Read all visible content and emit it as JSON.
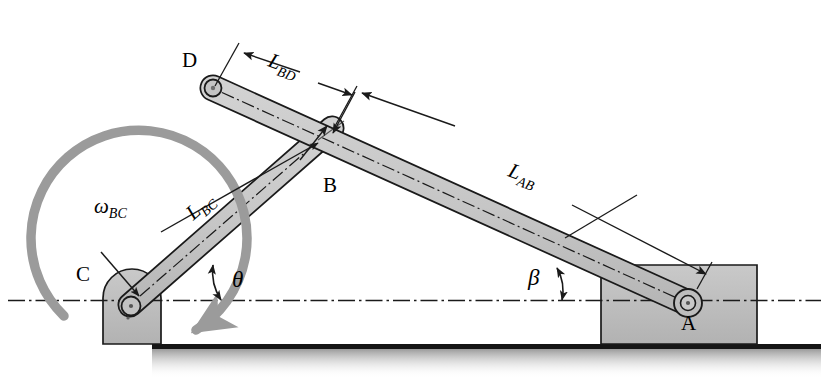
{
  "figure": {
    "type": "mechanism-kinematic-diagram",
    "background": "#ffffff"
  },
  "colors": {
    "link_fill": "#c8c8c8",
    "block_fill": "#bfbfbf",
    "outline": "#1a1a1a",
    "omega_arrow": "#9b9b9b",
    "ground_line": "#151515",
    "centerline": "#1a1a1a"
  },
  "joints": [
    {
      "id": "A",
      "label": "A",
      "x": 688,
      "y": 303,
      "kind": "pin-in-ground-block"
    },
    {
      "id": "B",
      "label": "B",
      "x": 330,
      "y": 130,
      "kind": "pin-joint"
    },
    {
      "id": "C",
      "label": "C",
      "x": 130,
      "y": 305,
      "kind": "pin-in-ground-block"
    },
    {
      "id": "D",
      "label": "D",
      "x": 213,
      "y": 88,
      "kind": "free-end-pin"
    }
  ],
  "point_labels": {
    "A": "A",
    "B": "B",
    "C": "C",
    "D": "D"
  },
  "dimensions": [
    {
      "id": "L_BD",
      "base": "L",
      "sub": "BD",
      "from": "D",
      "to": "B"
    },
    {
      "id": "L_AB",
      "base": "L",
      "sub": "AB",
      "from": "B",
      "to": "A"
    },
    {
      "id": "L_BC",
      "base": "L",
      "sub": "BC",
      "from": "C",
      "to": "B"
    }
  ],
  "angles": [
    {
      "id": "theta",
      "symbol": "θ",
      "between": "link BC and horizontal centerline"
    },
    {
      "id": "beta",
      "symbol": "β",
      "between": "link AB and horizontal centerline"
    }
  ],
  "velocities": [
    {
      "id": "omega_BC",
      "base": "ω",
      "sub": "BC",
      "sense": "counterclockwise",
      "color": "#9b9b9b"
    }
  ],
  "links": [
    {
      "id": "DA",
      "from": "D",
      "through": "B",
      "to": "A",
      "fill": "#c8c8c8"
    },
    {
      "id": "CB",
      "from": "C",
      "to": "B",
      "fill": "#c8c8c8"
    }
  ],
  "ground": {
    "line_y": 345,
    "style": "solid-line-with-shaded-fade"
  },
  "centerline": {
    "y": 300,
    "style": "dash-dot",
    "x_start": 8,
    "x_end": 821
  }
}
